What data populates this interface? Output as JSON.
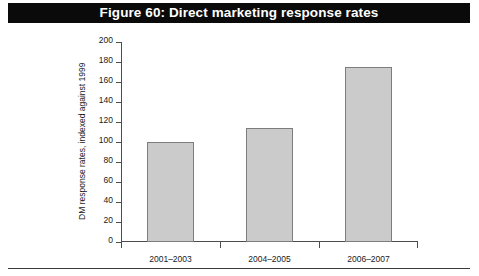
{
  "figure": {
    "title": "Figure 60: Direct marketing response rates",
    "title_bar_color": "#0a0a0a",
    "title_text_color": "#ffffff"
  },
  "chart_data": {
    "type": "bar",
    "title": "Figure 60: Direct marketing response rates",
    "categories": [
      "2001–2003",
      "2004–2005",
      "2006–2007"
    ],
    "values": [
      100,
      114,
      175
    ],
    "xlabel": "",
    "ylabel": "DM response rates, indexed against 1999",
    "ylim": [
      0,
      200
    ],
    "ytick_step": 20,
    "yticks": [
      0,
      20,
      40,
      60,
      80,
      100,
      120,
      140,
      160,
      180,
      200
    ],
    "ytick_labels": [
      "0",
      "20",
      "40",
      "60",
      "80",
      "100",
      "120",
      "140",
      "160",
      "180",
      "200"
    ],
    "grid": false,
    "legend": null,
    "bar_fill_color": "#cbcbcb",
    "bar_border_color": "#7d7d7d",
    "axis_color": "#4d4d4d",
    "background_color": "#ffffff"
  }
}
